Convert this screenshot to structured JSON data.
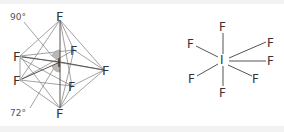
{
  "figure": {
    "left_diagram": {
      "description": "Pentagonal bipyramidal IF7 polyhedron with bond angles",
      "central_atom": "I",
      "ligands": [
        "F",
        "F",
        "F",
        "F",
        "F",
        "F",
        "F"
      ],
      "angle_labels": [
        "90°",
        "72°"
      ]
    },
    "right_diagram": {
      "description": "IF7 bond-line structure",
      "central_atom": "I",
      "ligands": [
        "F",
        "F",
        "F",
        "F",
        "F",
        "F",
        "F"
      ]
    },
    "colors": {
      "background": "#ffffff",
      "frame": "#f2f2f2",
      "line": "#777777",
      "angle_fill": "#b8b8b8",
      "text": "#333333"
    }
  }
}
